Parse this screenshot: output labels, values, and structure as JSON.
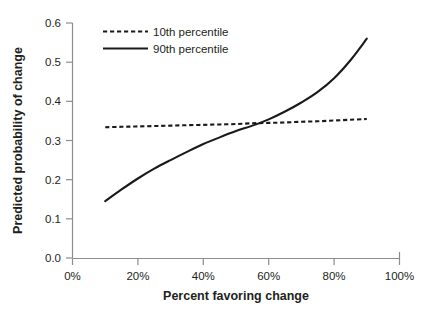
{
  "chart_data": {
    "type": "line",
    "title": "",
    "xlabel": "Percent favoring change",
    "ylabel": "Predicted probability of change",
    "xlim": [
      0,
      100
    ],
    "ylim": [
      0.0,
      0.6
    ],
    "grid": false,
    "legend_position": "top-left-inside",
    "x_tick_labels": [
      "0%",
      "20%",
      "40%",
      "60%",
      "80%",
      "100%"
    ],
    "x_tick_values": [
      0,
      20,
      40,
      60,
      80,
      100
    ],
    "y_tick_labels": [
      "0.0",
      "0.1",
      "0.2",
      "0.3",
      "0.4",
      "0.5",
      "0.6"
    ],
    "y_tick_values": [
      0.0,
      0.1,
      0.2,
      0.3,
      0.4,
      0.5,
      0.6
    ],
    "x": [
      10,
      15,
      20,
      25,
      30,
      35,
      40,
      45,
      50,
      55,
      60,
      65,
      70,
      75,
      80,
      85,
      90
    ],
    "series": [
      {
        "name": "10th percentile",
        "style": "dashed",
        "color": "#1a1a1a",
        "values": [
          0.334,
          0.335,
          0.336,
          0.337,
          0.338,
          0.339,
          0.34,
          0.341,
          0.342,
          0.344,
          0.345,
          0.346,
          0.348,
          0.349,
          0.351,
          0.353,
          0.355
        ]
      },
      {
        "name": "90th percentile",
        "style": "solid",
        "color": "#1a1a1a",
        "values": [
          0.145,
          0.175,
          0.203,
          0.228,
          0.25,
          0.271,
          0.291,
          0.308,
          0.324,
          0.338,
          0.354,
          0.374,
          0.397,
          0.424,
          0.459,
          0.505,
          0.56
        ]
      }
    ],
    "annotations": [
      {
        "text": "curves cross near 57% at probability 0.345"
      }
    ]
  },
  "legend": {
    "items": [
      {
        "label": "10th percentile",
        "style": "dashed"
      },
      {
        "label": "90th percentile",
        "style": "solid"
      }
    ]
  },
  "axes": {
    "x_title": "Percent favoring change",
    "y_title": "Predicted probability of change",
    "x_ticks": [
      "0%",
      "20%",
      "40%",
      "60%",
      "80%",
      "100%"
    ],
    "y_ticks": [
      "0.0",
      "0.1",
      "0.2",
      "0.3",
      "0.4",
      "0.5",
      "0.6"
    ]
  },
  "colors": {
    "line": "#1a1a1a",
    "axis": "#8c8c8c",
    "text": "#231f20",
    "background": "#ffffff"
  }
}
